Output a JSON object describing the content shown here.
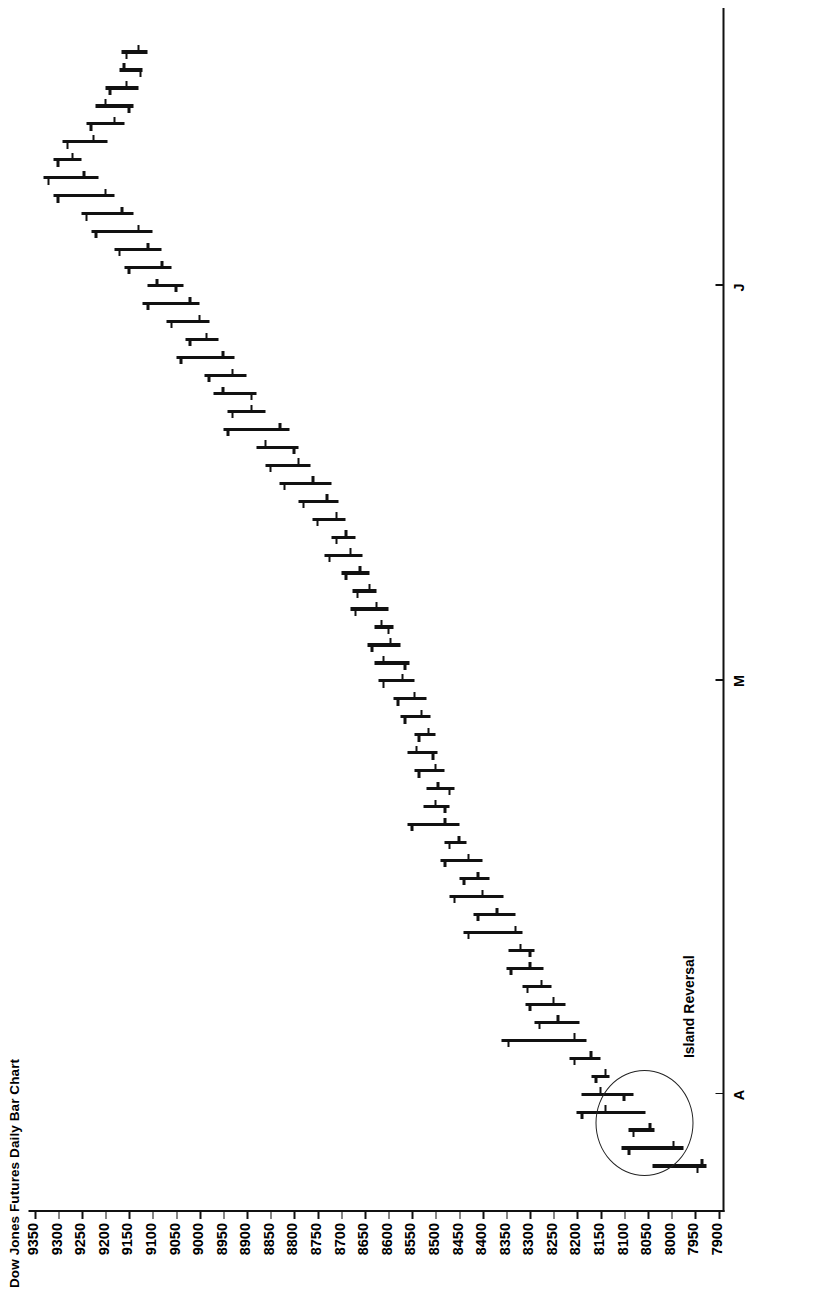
{
  "chart_data": {
    "type": "ohlc",
    "title": "Dow Jones Futures Daily Bar Chart",
    "xlabel": "",
    "ylabel": "",
    "orientation": "rotated-90-ccw",
    "grid": false,
    "legend": null,
    "ylim": [
      7900,
      9350
    ],
    "ytick_step": 50,
    "ytick_labels": [
      "9350",
      "9300",
      "9250",
      "9200",
      "9150",
      "9100",
      "9050",
      "9000",
      "8950",
      "8900",
      "8850",
      "8800",
      "8750",
      "8700",
      "8650",
      "8600",
      "8550",
      "8500",
      "8450",
      "8400",
      "8350",
      "8300",
      "8250",
      "8200",
      "8150",
      "8100",
      "8050",
      "8000",
      "7950",
      "7900"
    ],
    "xtick_labels": [
      "A",
      "M",
      "J"
    ],
    "xtick_index": [
      4,
      27,
      49
    ],
    "annotations": [
      {
        "text": "Island Reversal",
        "target_index": 2,
        "shape": "ellipse"
      }
    ],
    "bars": [
      {
        "i": 0,
        "high": 8040,
        "low": 7925,
        "open": 7945,
        "close": 7935
      },
      {
        "i": 1,
        "high": 8105,
        "low": 7975,
        "open": 8090,
        "close": 7995
      },
      {
        "i": 2,
        "high": 8090,
        "low": 8035,
        "open": 8080,
        "close": 8045
      },
      {
        "i": 3,
        "high": 8200,
        "low": 8055,
        "open": 8190,
        "close": 8140
      },
      {
        "i": 4,
        "high": 8190,
        "low": 8080,
        "open": 8100,
        "close": 8150
      },
      {
        "i": 5,
        "high": 8170,
        "low": 8130,
        "open": 8160,
        "close": 8140
      },
      {
        "i": 6,
        "high": 8215,
        "low": 8150,
        "open": 8205,
        "close": 8170
      },
      {
        "i": 7,
        "high": 8360,
        "low": 8180,
        "open": 8345,
        "close": 8205
      },
      {
        "i": 8,
        "high": 8290,
        "low": 8195,
        "open": 8280,
        "close": 8240
      },
      {
        "i": 9,
        "high": 8310,
        "low": 8225,
        "open": 8300,
        "close": 8250
      },
      {
        "i": 10,
        "high": 8315,
        "low": 8255,
        "open": 8305,
        "close": 8275
      },
      {
        "i": 11,
        "high": 8350,
        "low": 8270,
        "open": 8340,
        "close": 8300
      },
      {
        "i": 12,
        "high": 8345,
        "low": 8290,
        "open": 8300,
        "close": 8320
      },
      {
        "i": 13,
        "high": 8440,
        "low": 8315,
        "open": 8430,
        "close": 8330
      },
      {
        "i": 14,
        "high": 8420,
        "low": 8330,
        "open": 8410,
        "close": 8370
      },
      {
        "i": 15,
        "high": 8470,
        "low": 8355,
        "open": 8460,
        "close": 8400
      },
      {
        "i": 16,
        "high": 8450,
        "low": 8385,
        "open": 8440,
        "close": 8410
      },
      {
        "i": 17,
        "high": 8490,
        "low": 8400,
        "open": 8480,
        "close": 8430
      },
      {
        "i": 18,
        "high": 8480,
        "low": 8435,
        "open": 8470,
        "close": 8450
      },
      {
        "i": 19,
        "high": 8560,
        "low": 8450,
        "open": 8550,
        "close": 8480
      },
      {
        "i": 20,
        "high": 8525,
        "low": 8470,
        "open": 8480,
        "close": 8500
      },
      {
        "i": 21,
        "high": 8520,
        "low": 8460,
        "open": 8470,
        "close": 8495
      },
      {
        "i": 22,
        "high": 8545,
        "low": 8480,
        "open": 8535,
        "close": 8500
      },
      {
        "i": 23,
        "high": 8560,
        "low": 8495,
        "open": 8505,
        "close": 8540
      },
      {
        "i": 24,
        "high": 8545,
        "low": 8500,
        "open": 8535,
        "close": 8515
      },
      {
        "i": 25,
        "high": 8575,
        "low": 8510,
        "open": 8565,
        "close": 8530
      },
      {
        "i": 26,
        "high": 8590,
        "low": 8520,
        "open": 8580,
        "close": 8545
      },
      {
        "i": 27,
        "high": 8620,
        "low": 8545,
        "open": 8610,
        "close": 8570
      },
      {
        "i": 28,
        "high": 8630,
        "low": 8555,
        "open": 8565,
        "close": 8610
      },
      {
        "i": 29,
        "high": 8645,
        "low": 8575,
        "open": 8635,
        "close": 8595
      },
      {
        "i": 30,
        "high": 8630,
        "low": 8590,
        "open": 8600,
        "close": 8615
      },
      {
        "i": 31,
        "high": 8680,
        "low": 8600,
        "open": 8670,
        "close": 8625
      },
      {
        "i": 32,
        "high": 8675,
        "low": 8625,
        "open": 8665,
        "close": 8640
      },
      {
        "i": 33,
        "high": 8700,
        "low": 8640,
        "open": 8690,
        "close": 8660
      },
      {
        "i": 34,
        "high": 8735,
        "low": 8655,
        "open": 8725,
        "close": 8680
      },
      {
        "i": 35,
        "high": 8720,
        "low": 8670,
        "open": 8710,
        "close": 8690
      },
      {
        "i": 36,
        "high": 8760,
        "low": 8690,
        "open": 8750,
        "close": 8710
      },
      {
        "i": 37,
        "high": 8790,
        "low": 8705,
        "open": 8780,
        "close": 8730
      },
      {
        "i": 38,
        "high": 8830,
        "low": 8720,
        "open": 8820,
        "close": 8760
      },
      {
        "i": 39,
        "high": 8860,
        "low": 8765,
        "open": 8850,
        "close": 8790
      },
      {
        "i": 40,
        "high": 8880,
        "low": 8790,
        "open": 8800,
        "close": 8860
      },
      {
        "i": 41,
        "high": 8950,
        "low": 8810,
        "open": 8940,
        "close": 8830
      },
      {
        "i": 42,
        "high": 8940,
        "low": 8860,
        "open": 8930,
        "close": 8890
      },
      {
        "i": 43,
        "high": 8970,
        "low": 8880,
        "open": 8890,
        "close": 8950
      },
      {
        "i": 44,
        "high": 8990,
        "low": 8900,
        "open": 8980,
        "close": 8930
      },
      {
        "i": 45,
        "high": 9050,
        "low": 8925,
        "open": 9040,
        "close": 8950
      },
      {
        "i": 46,
        "high": 9030,
        "low": 8960,
        "open": 9020,
        "close": 8985
      },
      {
        "i": 47,
        "high": 9070,
        "low": 8980,
        "open": 9060,
        "close": 9000
      },
      {
        "i": 48,
        "high": 9120,
        "low": 9000,
        "open": 9110,
        "close": 9020
      },
      {
        "i": 49,
        "high": 9110,
        "low": 9035,
        "open": 9050,
        "close": 9090
      },
      {
        "i": 50,
        "high": 9160,
        "low": 9060,
        "open": 9150,
        "close": 9080
      },
      {
        "i": 51,
        "high": 9180,
        "low": 9080,
        "open": 9170,
        "close": 9110
      },
      {
        "i": 52,
        "high": 9230,
        "low": 9100,
        "open": 9220,
        "close": 9130
      },
      {
        "i": 53,
        "high": 9250,
        "low": 9140,
        "open": 9240,
        "close": 9165
      },
      {
        "i": 54,
        "high": 9310,
        "low": 9180,
        "open": 9300,
        "close": 9200
      },
      {
        "i": 55,
        "high": 9330,
        "low": 9215,
        "open": 9320,
        "close": 9245
      },
      {
        "i": 56,
        "high": 9310,
        "low": 9250,
        "open": 9300,
        "close": 9270
      },
      {
        "i": 57,
        "high": 9290,
        "low": 9195,
        "open": 9280,
        "close": 9225
      },
      {
        "i": 58,
        "high": 9240,
        "low": 9160,
        "open": 9230,
        "close": 9180
      },
      {
        "i": 59,
        "high": 9220,
        "low": 9140,
        "open": 9150,
        "close": 9200
      },
      {
        "i": 60,
        "high": 9200,
        "low": 9130,
        "open": 9190,
        "close": 9155
      },
      {
        "i": 61,
        "high": 9170,
        "low": 9120,
        "open": 9125,
        "close": 9160
      },
      {
        "i": 62,
        "high": 9165,
        "low": 9110,
        "open": 9155,
        "close": 9130
      }
    ]
  },
  "colors": {
    "ink": "#111111",
    "axis": "#1a1a1a",
    "background": "#ffffff"
  }
}
